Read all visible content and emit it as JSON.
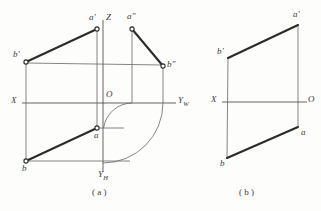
{
  "figure": {
    "background_color": "#fdfdfb",
    "ink_color": "#2b2b2b",
    "thin_line_color": "#6a6566",
    "panels": [
      {
        "id": "panel-a",
        "caption": "( a )",
        "kind": "three-view-projection",
        "origin_label": "O",
        "axes": [
          {
            "name": "x-axis",
            "label": "X"
          },
          {
            "name": "yw-axis",
            "label": "Y",
            "subscript": "W"
          },
          {
            "name": "z-axis",
            "label": "Z"
          },
          {
            "name": "yh-axis",
            "label": "Y",
            "subscript": "H"
          }
        ],
        "points": [
          {
            "name": "a-prime",
            "label": "a'"
          },
          {
            "name": "a-double-prime",
            "label": "a\""
          },
          {
            "name": "b-prime",
            "label": "b'"
          },
          {
            "name": "b-double-prime",
            "label": "b\""
          },
          {
            "name": "a-plain",
            "label": "a"
          },
          {
            "name": "b-plain",
            "label": "b"
          }
        ],
        "heavy_segments": [
          {
            "name": "front-view-line",
            "from": "b'",
            "to": "a'"
          },
          {
            "name": "side-view-line",
            "from": "a\"",
            "to": "b\""
          },
          {
            "name": "top-view-line",
            "from": "b",
            "to": "a"
          }
        ],
        "arcs": 2
      },
      {
        "id": "panel-b",
        "caption": "( b )",
        "kind": "two-view-projection",
        "origin_label": "O",
        "axes": [
          {
            "name": "x-axis",
            "label": "X"
          }
        ],
        "points": [
          {
            "name": "a-prime",
            "label": "a'"
          },
          {
            "name": "b-prime",
            "label": "b'"
          },
          {
            "name": "a-plain",
            "label": "a"
          },
          {
            "name": "b-plain",
            "label": "b"
          }
        ],
        "heavy_segments": [
          {
            "name": "front-view-line",
            "from": "b'",
            "to": "a'"
          },
          {
            "name": "top-view-line",
            "from": "b",
            "to": "a"
          }
        ],
        "arcs": 0
      }
    ]
  },
  "labels": {
    "panel_a": {
      "a_prime": "a'",
      "a_double_prime": "a\"",
      "b_prime": "b'",
      "b_double_prime": "b\"",
      "a_plain": "a",
      "b_plain": "b",
      "origin": "O",
      "axis_x": "X",
      "axis_z": "Z",
      "axis_yw_main": "Y",
      "axis_yw_sub": "W",
      "axis_yh_main": "Y",
      "axis_yh_sub": "H",
      "caption": "( a )"
    },
    "panel_b": {
      "a_prime": "a'",
      "b_prime": "b'",
      "a_plain": "a",
      "b_plain": "b",
      "origin": "O",
      "axis_x": "X",
      "caption": "( b )"
    }
  }
}
